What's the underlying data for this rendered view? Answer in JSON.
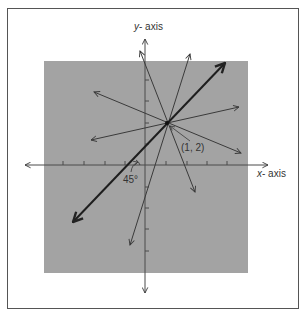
{
  "diagram": {
    "y_axis_label_var": "y",
    "y_axis_label_rest": "- axis",
    "x_axis_label_var": "x",
    "x_axis_label_rest": "- axis",
    "point_label": "(1, 2)",
    "angle_label": "45°",
    "colors": {
      "background": "#ffffff",
      "panel": "#a3a3a3",
      "line": "#3a3a3a",
      "frame": "#555555"
    },
    "point": {
      "x": 1,
      "y": 2
    },
    "lines_through_point": 6,
    "emphasized_line": {
      "angle_deg": 45,
      "through": [
        1,
        2
      ]
    }
  }
}
